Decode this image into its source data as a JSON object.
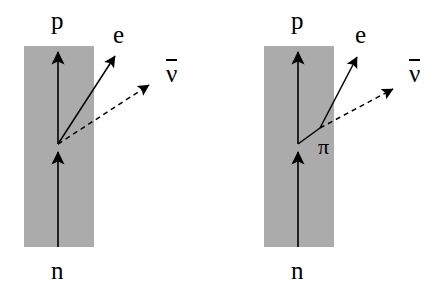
{
  "figure": {
    "background_color": "#ffffff",
    "slab_color": "#ababab",
    "line_color": "#000000"
  },
  "panels": [
    {
      "id": "left-panel",
      "name": "direct-beta-decay",
      "slab": {
        "x": 24,
        "y": 46,
        "width": 70,
        "height": 201
      },
      "vertex": {
        "x": 58,
        "y": 144
      },
      "labels": {
        "proton": "p",
        "neutron": "n",
        "electron": "e",
        "antineutrino": "ν"
      },
      "label_positions": {
        "proton": {
          "x": 51,
          "y": 8
        },
        "neutron": {
          "x": 51,
          "y": 258
        },
        "electron": {
          "x": 113,
          "y": 22
        },
        "antineutrino": {
          "x": 166,
          "y": 58
        }
      },
      "lines": {
        "neutron_in": {
          "x1": 58,
          "y1": 247,
          "x2": 58,
          "y2": 150
        },
        "proton_out": {
          "x1": 58,
          "y1": 144,
          "x2": 58,
          "y2": 48
        },
        "electron_out": {
          "x1": 58,
          "y1": 144,
          "x2": 117,
          "y2": 53
        },
        "antineutrino_out": {
          "x1": 58,
          "y1": 144,
          "x2": 152,
          "y2": 83
        }
      }
    },
    {
      "id": "right-panel",
      "name": "pion-mediated-beta-decay",
      "slab": {
        "x": 264,
        "y": 46,
        "width": 70,
        "height": 201
      },
      "vertex": {
        "x": 298,
        "y": 144
      },
      "kink": {
        "x": 320,
        "y": 128
      },
      "labels": {
        "proton": "p",
        "neutron": "n",
        "electron": "e",
        "antineutrino": "ν",
        "pion": "π"
      },
      "label_positions": {
        "proton": {
          "x": 291,
          "y": 8
        },
        "neutron": {
          "x": 291,
          "y": 258
        },
        "electron": {
          "x": 355,
          "y": 22
        },
        "antineutrino": {
          "x": 409,
          "y": 58
        },
        "pion": {
          "x": 318,
          "y": 136
        }
      },
      "lines": {
        "neutron_in": {
          "x1": 298,
          "y1": 247,
          "x2": 298,
          "y2": 150
        },
        "proton_out": {
          "x1": 298,
          "y1": 144,
          "x2": 298,
          "y2": 48
        },
        "pion_internal": {
          "x1": 298,
          "y1": 144,
          "x2": 320,
          "y2": 128
        },
        "electron_out": {
          "x1": 320,
          "y1": 128,
          "x2": 359,
          "y2": 53
        },
        "antineutrino_out": {
          "x1": 320,
          "y1": 128,
          "x2": 396,
          "y2": 87
        }
      }
    }
  ]
}
